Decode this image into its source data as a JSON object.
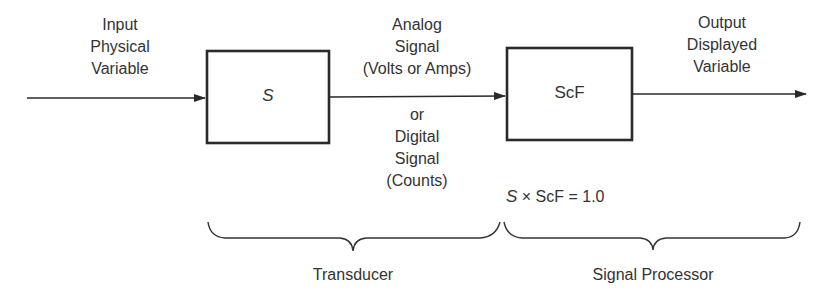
{
  "diagram": {
    "input_label": [
      "Input",
      "Physical",
      "Variable"
    ],
    "transducer_block": {
      "label": "S"
    },
    "signal_label_top": [
      "Analog",
      "Signal",
      "(Volts or Amps)"
    ],
    "signal_label_bottom": [
      "or",
      "Digital",
      "Signal",
      "(Counts)"
    ],
    "processor_block": {
      "label": "ScF"
    },
    "output_label": [
      "Output",
      "Displayed",
      "Variable"
    ],
    "equation": {
      "s": "S",
      "rest": "× ScF = 1.0"
    },
    "groups": [
      {
        "label": "Transducer"
      },
      {
        "label": "Signal Processor"
      }
    ]
  }
}
